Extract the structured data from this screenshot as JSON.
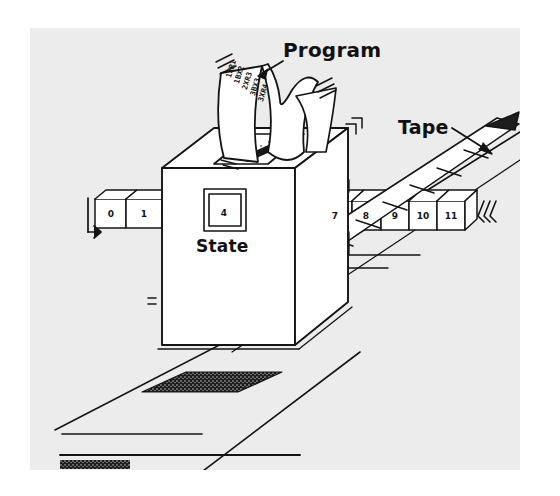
{
  "figure": {
    "title_alt": "Turing machine schematic",
    "background_color": "#ffffff",
    "plate_color": "#ececec",
    "ink_color": "#141414"
  },
  "labels": {
    "program": "Program",
    "tape": "Tape",
    "state": "State"
  },
  "state_unit": {
    "value": "4"
  },
  "tape": {
    "left_cells": [
      "0",
      "1"
    ],
    "right_cells": [
      "7",
      "8",
      "9",
      "10",
      "11"
    ],
    "hatched_cells_count": 6
  },
  "program_strip": {
    "lines": [
      "1XR1",
      "1BX2",
      "2XR3",
      "3BX3",
      "3XR4"
    ]
  }
}
